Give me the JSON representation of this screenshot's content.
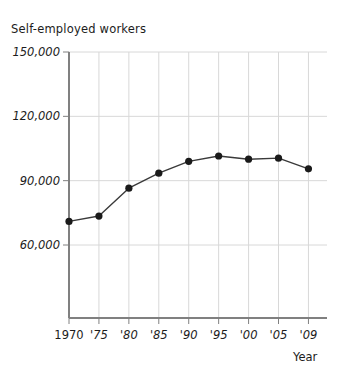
{
  "chart_data": {
    "type": "line",
    "title": "Self-employed workers",
    "xlabel": "Year",
    "ylabel": "Self-employed workers",
    "categories": [
      "1970",
      "'75",
      "'80",
      "'85",
      "'90",
      "'95",
      "'00",
      "'05",
      "'09"
    ],
    "x": [
      1970,
      1975,
      1980,
      1985,
      1990,
      1995,
      2000,
      2005,
      2009
    ],
    "values": [
      71000,
      73500,
      86500,
      93500,
      99000,
      101500,
      100000,
      100500,
      95500
    ],
    "ylim": [
      0,
      150000
    ],
    "yticks": [
      60000,
      90000,
      120000,
      150000
    ],
    "ytick_labels": [
      "60,000",
      "90,000",
      "120,000",
      "150,000"
    ],
    "grid": true,
    "legend": "none",
    "marker": "filled-circle",
    "line_color": "#3a3a3a",
    "marker_color": "#1a1a1a",
    "grid_color": "#d8d8d8",
    "axis_color": "#808080"
  },
  "axis_titles": {
    "x_axis_name": "Year",
    "y_axis_name": "Self-employed workers"
  }
}
